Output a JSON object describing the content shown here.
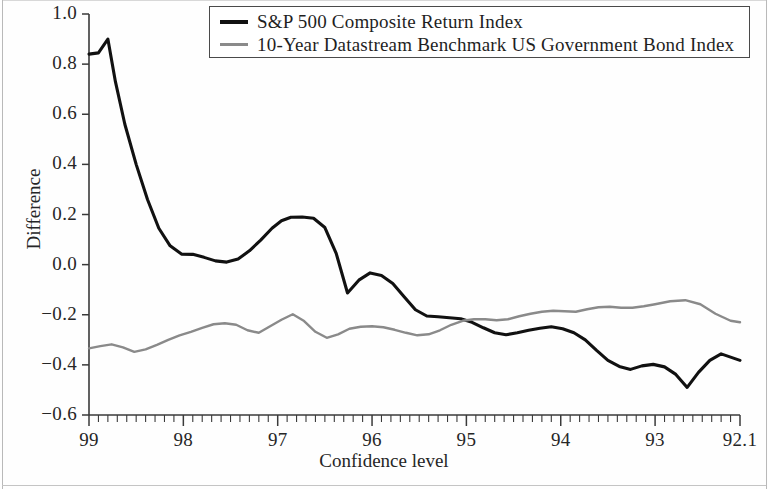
{
  "chart_data": {
    "type": "line",
    "title": "",
    "xlabel": "Confidence level",
    "ylabel": "Difference",
    "ylim": [
      -0.6,
      1.0
    ],
    "yticks": [
      "1.0",
      "0.8",
      "0.6",
      "0.4",
      "0.2",
      "0.0",
      "−0.2",
      "−0.4",
      "−0.6"
    ],
    "ytick_values": [
      1.0,
      0.8,
      0.6,
      0.4,
      0.2,
      0.0,
      -0.2,
      -0.4,
      -0.6
    ],
    "xticks": [
      "99",
      "98",
      "97",
      "96",
      "95",
      "94",
      "93",
      "92.1"
    ],
    "xtick_values": [
      99,
      98,
      97,
      96,
      95,
      94,
      93,
      92.1
    ],
    "x_axis_direction": "decreasing",
    "grid": false,
    "legend_position": "top-center",
    "minor_ticks_per_interval": 10,
    "series": [
      {
        "name": "S&P 500 Composite Return Index",
        "color": "#111111",
        "width": 3.1,
        "x": [
          99.0,
          98.9,
          98.8,
          98.72,
          98.62,
          98.5,
          98.38,
          98.26,
          98.14,
          98.02,
          97.9,
          97.78,
          97.66,
          97.54,
          97.42,
          97.3,
          97.18,
          97.06,
          96.96,
          96.86,
          96.74,
          96.62,
          96.5,
          96.38,
          96.26,
          96.14,
          96.02,
          95.9,
          95.78,
          95.66,
          95.54,
          95.42,
          95.3,
          95.18,
          95.06,
          94.94,
          94.82,
          94.7,
          94.58,
          94.46,
          94.34,
          94.22,
          94.1,
          93.98,
          93.86,
          93.74,
          93.62,
          93.5,
          93.38,
          93.26,
          93.14,
          93.02,
          92.9,
          92.78,
          92.66,
          92.54,
          92.42,
          92.3,
          92.1
        ],
        "y": [
          0.84,
          0.845,
          0.9,
          0.73,
          0.56,
          0.4,
          0.26,
          0.145,
          0.075,
          0.042,
          0.041,
          0.029,
          0.015,
          0.01,
          0.022,
          0.055,
          0.098,
          0.145,
          0.175,
          0.189,
          0.19,
          0.185,
          0.148,
          0.045,
          -0.113,
          -0.062,
          -0.033,
          -0.043,
          -0.075,
          -0.128,
          -0.18,
          -0.205,
          -0.208,
          -0.212,
          -0.216,
          -0.23,
          -0.252,
          -0.272,
          -0.28,
          -0.272,
          -0.262,
          -0.254,
          -0.248,
          -0.256,
          -0.272,
          -0.3,
          -0.342,
          -0.382,
          -0.406,
          -0.418,
          -0.404,
          -0.398,
          -0.408,
          -0.438,
          -0.49,
          -0.43,
          -0.382,
          -0.356,
          -0.382
        ]
      },
      {
        "name": "10-Year Datastream Benchmark US Government Bond Index",
        "color": "#8a8a8a",
        "width": 2.4,
        "x": [
          99.0,
          98.88,
          98.76,
          98.64,
          98.52,
          98.4,
          98.28,
          98.16,
          98.04,
          97.92,
          97.8,
          97.68,
          97.56,
          97.44,
          97.32,
          97.2,
          97.08,
          96.96,
          96.84,
          96.72,
          96.6,
          96.48,
          96.36,
          96.24,
          96.12,
          96.0,
          95.88,
          95.76,
          95.64,
          95.52,
          95.4,
          95.28,
          95.16,
          95.04,
          94.92,
          94.8,
          94.68,
          94.56,
          94.44,
          94.32,
          94.2,
          94.08,
          93.96,
          93.84,
          93.72,
          93.6,
          93.48,
          93.36,
          93.24,
          93.12,
          93.0,
          92.84,
          92.68,
          92.52,
          92.36,
          92.2,
          92.1
        ],
        "y": [
          -0.334,
          -0.325,
          -0.318,
          -0.33,
          -0.348,
          -0.338,
          -0.32,
          -0.3,
          -0.282,
          -0.268,
          -0.252,
          -0.238,
          -0.234,
          -0.24,
          -0.262,
          -0.272,
          -0.246,
          -0.22,
          -0.198,
          -0.225,
          -0.268,
          -0.292,
          -0.278,
          -0.256,
          -0.248,
          -0.246,
          -0.25,
          -0.26,
          -0.272,
          -0.282,
          -0.278,
          -0.262,
          -0.24,
          -0.224,
          -0.218,
          -0.218,
          -0.222,
          -0.218,
          -0.206,
          -0.196,
          -0.188,
          -0.184,
          -0.186,
          -0.188,
          -0.178,
          -0.17,
          -0.168,
          -0.172,
          -0.172,
          -0.166,
          -0.158,
          -0.146,
          -0.142,
          -0.158,
          -0.196,
          -0.224,
          -0.23
        ]
      }
    ]
  },
  "legend": {
    "items": [
      {
        "label": "S&P 500 Composite Return Index",
        "swatch": "black-line-swatch"
      },
      {
        "label": "10-Year Datastream Benchmark US Government Bond Index",
        "swatch": "gray-line-swatch"
      }
    ]
  },
  "axes": {
    "y_title": "Difference",
    "x_title": "Confidence level"
  },
  "colors": {
    "series_black": "#111111",
    "series_gray": "#8a8a8a",
    "axis": "#3a3a3a",
    "text": "#262626",
    "background": "#ffffff"
  }
}
